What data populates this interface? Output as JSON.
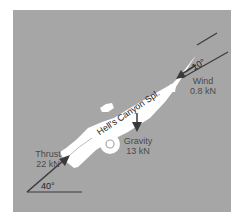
{
  "diagram": {
    "vehicle_label": "Hell's Canyon Spl.",
    "forces": [
      {
        "name": "Thrust",
        "magnitude": "22 kN",
        "angle_label": "40°"
      },
      {
        "name": "Gravity",
        "magnitude": "13 kN"
      },
      {
        "name": "Wind",
        "magnitude": "0.8 kN",
        "angle_label": "10°"
      }
    ],
    "colors": {
      "background": "#a6a6a6",
      "vehicle": "#ffffff",
      "arrow": "#3a3a3a",
      "label": "#4a4a4a"
    }
  }
}
